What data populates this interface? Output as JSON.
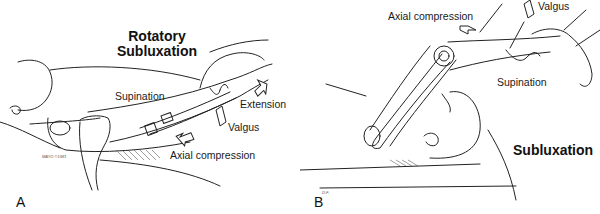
{
  "figure": {
    "panel_a": {
      "letter": "A",
      "title_line1": "Rotatory",
      "title_line2": "Subluxation",
      "labels": {
        "supination": "Supination",
        "extension": "Extension",
        "valgus": "Valgus",
        "axial_compression": "Axial compression"
      },
      "signature": "MAYO ©1981"
    },
    "panel_b": {
      "letter": "B",
      "title": "Subluxation",
      "labels": {
        "axial_compression": "Axial compression",
        "valgus": "Valgus",
        "supination": "Supination"
      },
      "signature": "D.F."
    }
  }
}
